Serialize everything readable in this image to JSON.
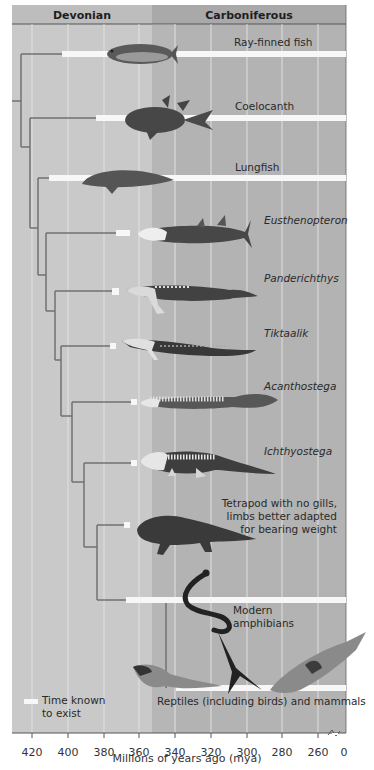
{
  "figure": {
    "periods": [
      {
        "name": "Devonian",
        "start_mya": 419,
        "end_mya": 359
      },
      {
        "name": "Carboniferous",
        "start_mya": 359,
        "end_mya": 0
      }
    ],
    "x_axis": {
      "title": "Millions of years ago (mya)",
      "ticks": [
        "420",
        "400",
        "380",
        "360",
        "340",
        "320",
        "300",
        "280",
        "260",
        "0"
      ],
      "axis_break": "between 260 and 0"
    },
    "legend": {
      "swatch_label": "Time known to exist",
      "line1": "Time known",
      "line2": "to exist"
    },
    "taxa": [
      {
        "id": "ray-finned-fish",
        "label": "Ray-finned fish",
        "italic": false,
        "bar_start_mya": 403,
        "bar_end_mya": 0
      },
      {
        "id": "coelocanth",
        "label": "Coelocanth",
        "italic": false,
        "bar_start_mya": 385,
        "bar_end_mya": 0
      },
      {
        "id": "lungfish",
        "label": "Lungfish",
        "italic": false,
        "bar_start_mya": 410,
        "bar_end_mya": 0
      },
      {
        "id": "eusthenopteron",
        "label": "Eusthenopteron",
        "italic": true,
        "bar_start_mya": 385,
        "bar_end_mya": 378
      },
      {
        "id": "panderichthys",
        "label": "Panderichthys",
        "italic": true,
        "bar_start_mya": 382,
        "bar_end_mya": 379
      },
      {
        "id": "tiktaalik",
        "label": "Tiktaalik",
        "italic": true,
        "bar_start_mya": 383,
        "bar_end_mya": 380
      },
      {
        "id": "acanthostega",
        "label": "Acanthostega",
        "italic": true,
        "bar_start_mya": 371,
        "bar_end_mya": 368
      },
      {
        "id": "ichthyostega",
        "label": "Ichthyostega",
        "italic": true,
        "bar_start_mya": 371,
        "bar_end_mya": 368
      },
      {
        "id": "tetrapod-no-gills",
        "label_lines": [
          "Tetrapod with no gills,",
          "limbs better adapted",
          "for bearing weight"
        ],
        "italic": false,
        "bar_start_mya": 374,
        "bar_end_mya": 371
      },
      {
        "id": "modern-amphibians",
        "label_lines": [
          "Modern",
          "amphibians"
        ],
        "italic": false,
        "bar_start_mya": 365,
        "bar_end_mya": 0
      },
      {
        "id": "reptiles-mammals",
        "label": "Reptiles (including birds) and mammals",
        "italic": false,
        "bar_start_mya": 340,
        "bar_end_mya": 0
      }
    ],
    "colors": {
      "devonian_bg": "#c9c9c9",
      "carboniferous_bg": "#b3b3b3",
      "header_devonian": "#bdbdbd",
      "header_carboniferous": "#a9a9a9",
      "branch": "#6f6f6f",
      "bar": "#f7f7f7",
      "gridline": "#e6e6e6",
      "animal_dark": "#4a4a4a"
    }
  }
}
